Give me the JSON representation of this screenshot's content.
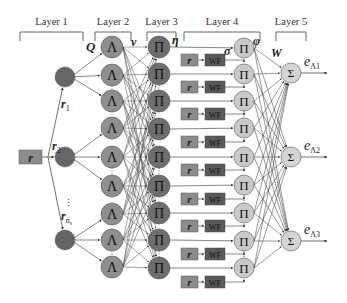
{
  "layers": [
    {
      "label": "Layer 1",
      "bracket_x": [
        20,
        83
      ]
    },
    {
      "label": "Layer 2",
      "bracket_x": [
        95,
        131
      ]
    },
    {
      "label": "Layer 3",
      "bracket_x": [
        147,
        176
      ]
    },
    {
      "label": "Layer 4",
      "bracket_x": [
        184,
        260
      ]
    },
    {
      "label": "Layer 5",
      "bracket_x": [
        276,
        306
      ]
    }
  ],
  "input": {
    "label": "r",
    "color": "#8c8c8c"
  },
  "input_branches": [
    {
      "label": "r",
      "sub": "1"
    },
    {
      "label": "r",
      "sub": "2"
    },
    {
      "label": "r",
      "sub": "n",
      "sub_sub": "s"
    }
  ],
  "vertical_ellipsis": "⋮",
  "layer1_nodes": [
    {
      "y": 77
    },
    {
      "y": 157
    },
    {
      "y": 240
    }
  ],
  "layer2_nodes": {
    "symbol": "Λ",
    "ys": [
      47,
      75,
      101,
      128,
      157,
      186,
      214,
      240,
      267
    ]
  },
  "layer3_nodes": {
    "symbol": "Π",
    "ys": [
      47,
      74,
      101,
      129,
      157,
      186,
      213,
      240,
      268
    ]
  },
  "layer4_nodes": {
    "symbol": "Π",
    "ys": [
      48,
      74,
      101,
      128,
      157,
      185,
      213,
      241,
      268
    ]
  },
  "layer4_inputs": {
    "r_label": "r",
    "wf_label": "WF",
    "ys": [
      60,
      87,
      114,
      142,
      170,
      199,
      226,
      254,
      282
    ]
  },
  "layer5_nodes": {
    "symbol": "Σ",
    "ys": [
      73,
      157,
      241
    ]
  },
  "outputs": [
    {
      "label": "e",
      "sub": "Λ1"
    },
    {
      "label": "e",
      "sub": "Λ2"
    },
    {
      "label": "e",
      "sub": "Λ3"
    }
  ],
  "weight_labels": {
    "Q": "Q",
    "v": "v",
    "eta": "η",
    "sigma": "σ",
    "phi": "φ",
    "W": "W"
  },
  "colors": {
    "layer1_fill": "#666666",
    "layer2_fill": "#8f8f8f",
    "layer3_fill": "#6e6e6e",
    "layer4_fill": "#c9c9c9",
    "layer5_fill": "#d4d4d4",
    "r_box_fill": "#8c8c8c",
    "wf_box_fill": "#5a5a5a",
    "line": "#333333"
  }
}
